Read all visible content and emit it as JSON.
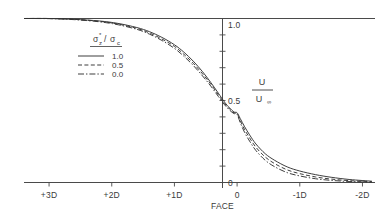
{
  "chart_data": {
    "type": "line",
    "title": "",
    "xlabel": "FACE",
    "ylabel": "U/U∞",
    "xlim": [
      3.4,
      -2.2
    ],
    "ylim": [
      0.0,
      1.0
    ],
    "grid": false,
    "legend_position": "upper-left-inside",
    "legend_title": "σ*z/σc",
    "x_tick_labels": [
      "+3D",
      "+2D",
      "+1D",
      "0",
      "-1D",
      "-2D"
    ],
    "x_tick_values": [
      3,
      2,
      1,
      0,
      -1,
      -2
    ],
    "y_tick_labels": [
      "1.0",
      "0.5",
      "0"
    ],
    "y_tick_values": [
      1.0,
      0.5,
      0.0
    ],
    "y_minor_tick_step": 0.1,
    "origin_label": "FACE",
    "axis_color": "#4a4a4a",
    "curve_color": "#333333",
    "series": [
      {
        "name": "1.0",
        "style": "solid",
        "x": [
          3.4,
          3.0,
          2.6,
          2.2,
          1.9,
          1.6,
          1.4,
          1.2,
          1.0,
          0.85,
          0.7,
          0.55,
          0.42,
          0.3,
          0.2,
          0.12,
          0.05,
          0.0,
          -0.05,
          -0.12,
          -0.2,
          -0.3,
          -0.45,
          -0.6,
          -0.8,
          -1.0,
          -1.25,
          -1.5,
          -1.8,
          -2.15
        ],
        "y": [
          1.0,
          1.0,
          0.995,
          0.985,
          0.97,
          0.945,
          0.92,
          0.885,
          0.84,
          0.795,
          0.74,
          0.675,
          0.61,
          0.545,
          0.49,
          0.455,
          0.43,
          0.425,
          0.39,
          0.34,
          0.29,
          0.235,
          0.175,
          0.135,
          0.095,
          0.07,
          0.048,
          0.032,
          0.018,
          0.008
        ]
      },
      {
        "name": "0.5",
        "style": "dashed",
        "x": [
          3.4,
          3.0,
          2.6,
          2.2,
          1.9,
          1.6,
          1.4,
          1.2,
          1.0,
          0.85,
          0.7,
          0.55,
          0.42,
          0.3,
          0.2,
          0.12,
          0.05,
          0.0,
          -0.05,
          -0.12,
          -0.2,
          -0.3,
          -0.45,
          -0.6,
          -0.8,
          -1.0,
          -1.25,
          -1.5,
          -1.8,
          -2.15
        ],
        "y": [
          1.0,
          1.0,
          0.995,
          0.983,
          0.966,
          0.94,
          0.912,
          0.875,
          0.83,
          0.782,
          0.727,
          0.662,
          0.6,
          0.535,
          0.482,
          0.448,
          0.425,
          0.42,
          0.378,
          0.322,
          0.272,
          0.215,
          0.155,
          0.115,
          0.077,
          0.054,
          0.034,
          0.021,
          0.011,
          0.005
        ]
      },
      {
        "name": "0.0",
        "style": "dashdot",
        "x": [
          3.4,
          3.0,
          2.6,
          2.2,
          1.9,
          1.6,
          1.4,
          1.2,
          1.0,
          0.85,
          0.7,
          0.55,
          0.42,
          0.3,
          0.2,
          0.12,
          0.05,
          0.0,
          -0.05,
          -0.12,
          -0.2,
          -0.3,
          -0.45,
          -0.6,
          -0.8,
          -1.0,
          -1.25,
          -1.5,
          -1.8,
          -2.15
        ],
        "y": [
          1.0,
          0.999,
          0.993,
          0.98,
          0.962,
          0.934,
          0.905,
          0.866,
          0.818,
          0.77,
          0.714,
          0.649,
          0.588,
          0.525,
          0.474,
          0.441,
          0.42,
          0.415,
          0.365,
          0.305,
          0.252,
          0.195,
          0.135,
          0.096,
          0.06,
          0.04,
          0.023,
          0.013,
          0.006,
          0.002
        ]
      }
    ]
  },
  "legend": {
    "title_base": "σ",
    "title_sup": "*",
    "title_sub1": "z",
    "title_slash": "/",
    "title_base2": "σ",
    "title_sub2": "c",
    "entries": [
      {
        "label": "1.0",
        "style": "solid"
      },
      {
        "label": "0.5",
        "style": "dashed"
      },
      {
        "label": "0.0",
        "style": "dashdot"
      }
    ]
  },
  "yaxis_label": {
    "numerator": "U",
    "denominator_base": "U",
    "denominator_sub": "∞"
  },
  "xaxis": {
    "ticks": [
      {
        "label": "+3D",
        "value": 3
      },
      {
        "label": "+2D",
        "value": 2
      },
      {
        "label": "+1D",
        "value": 1
      },
      {
        "label": "0",
        "value": 0
      },
      {
        "label": "-1D",
        "value": -1
      },
      {
        "label": "-2D",
        "value": -2
      }
    ],
    "origin_caption": "FACE"
  },
  "yaxis": {
    "ticks": [
      {
        "label": "1.0",
        "value": 1.0
      },
      {
        "label": "0.5",
        "value": 0.5
      },
      {
        "label": "0",
        "value": 0.0
      }
    ]
  }
}
